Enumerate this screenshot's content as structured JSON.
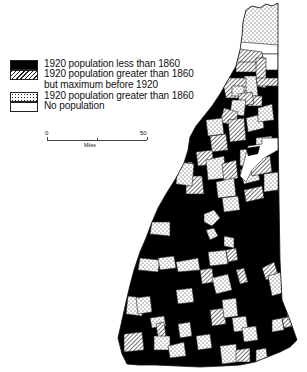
{
  "map": {
    "subject": "New Hampshire towns",
    "colors": {
      "ink": "#000000",
      "paper": "#ffffff",
      "border": "#222222"
    }
  },
  "legend": {
    "items": [
      {
        "pattern": "solid-black",
        "label": "1920 population less than 1860"
      },
      {
        "pattern": "diagonal-hatch",
        "label": "1920 population greater than 1860",
        "label_line2": "but maximum before 1920"
      },
      {
        "pattern": "stipple-dots",
        "label": "1920 population greater than 1860"
      },
      {
        "pattern": "empty",
        "label": "No population"
      }
    ]
  },
  "scale": {
    "start_label": "0",
    "end_label": "50",
    "unit": "Miles"
  }
}
